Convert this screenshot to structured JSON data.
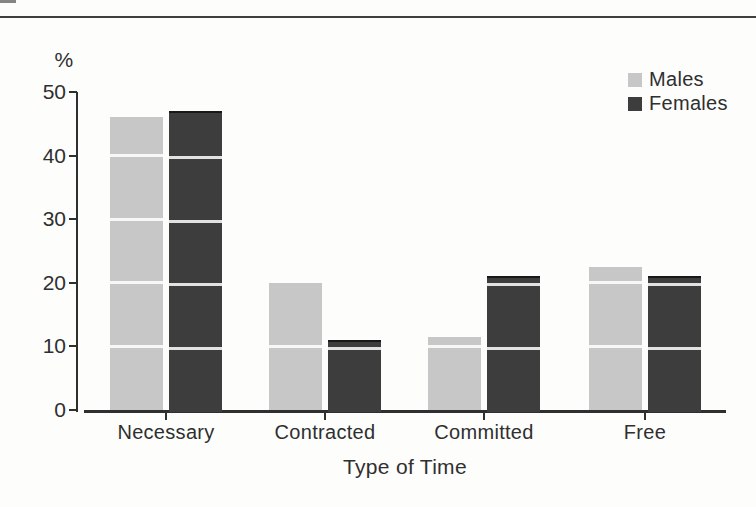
{
  "page": {
    "background": "#fdfdfc",
    "top_rule_color": "#3f3f3f"
  },
  "chart_data": {
    "type": "bar",
    "title": "",
    "xlabel": "Type of Time",
    "ylabel": "%",
    "categories": [
      "Necessary",
      "Contracted",
      "Committed",
      "Free"
    ],
    "series": [
      {
        "name": "Males",
        "color": "#c7c7c7",
        "values": [
          46,
          20,
          11.5,
          22.5
        ]
      },
      {
        "name": "Females",
        "color": "#3d3d3d",
        "values": [
          47,
          11,
          21,
          21
        ]
      }
    ],
    "ylim": [
      0,
      50
    ],
    "yticks": [
      0,
      10,
      20,
      30,
      40,
      50
    ],
    "grid": "white horizontal stripes overlaid on bars at each 10% step",
    "legend_position": "top-right",
    "legend_labels": [
      "Males",
      "Females"
    ]
  }
}
